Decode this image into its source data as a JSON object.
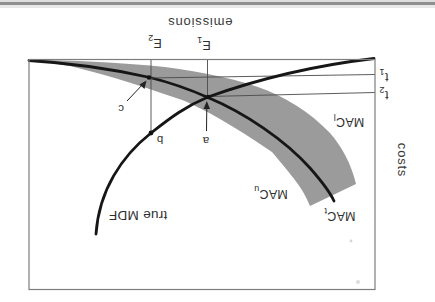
{
  "figure": {
    "axes": {
      "x_label": "emissions",
      "y_label": "costs"
    },
    "ticks": {
      "e1": {
        "base": "E",
        "sub": "1"
      },
      "e2": {
        "base": "E",
        "sub": "2"
      },
      "t1": {
        "base": "t",
        "sub": "1"
      },
      "t2": {
        "base": "t",
        "sub": "2"
      }
    },
    "curves": {
      "mdf_label": "true MDF",
      "mac_upper": {
        "base": "MAC",
        "sub": "u"
      },
      "mac_lower": {
        "base": "MAC",
        "sub": "l"
      },
      "mac_central": {
        "base": "MAC",
        "sub": "t"
      }
    },
    "points": {
      "a": "a",
      "b": "b",
      "c": "c"
    },
    "colors": {
      "band_gray": "#9b9b9b",
      "curve_black": "#161616",
      "frame_gray": "#7d7d7d",
      "guide_gray": "#4a4a4a",
      "text": "#2e2e2e",
      "scan_strip": "#8f8f8f"
    }
  }
}
